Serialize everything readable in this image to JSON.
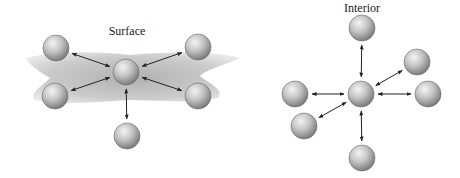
{
  "diagram": {
    "surface": {
      "label": "Surface",
      "label_pos": [
        127,
        35
      ],
      "center": [
        126,
        72
      ],
      "neighbors": [
        [
          56,
          48
        ],
        [
          198,
          47
        ],
        [
          55,
          96
        ],
        [
          198,
          96
        ],
        [
          127,
          136
        ]
      ]
    },
    "interior": {
      "label": "Interior",
      "label_pos": [
        362,
        12
      ],
      "center": [
        361,
        94
      ],
      "neighbors": [
        [
          362,
          28
        ],
        [
          417,
          62
        ],
        [
          428,
          94
        ],
        [
          295,
          94
        ],
        [
          304,
          126
        ],
        [
          362,
          158
        ]
      ]
    },
    "sphere_radius": 13,
    "colors": {
      "sphere_light": "#f0f0f0",
      "sphere_dark": "#7a7a7a",
      "arrow": "#222222",
      "surface_fill": "#b5b5b5"
    }
  }
}
